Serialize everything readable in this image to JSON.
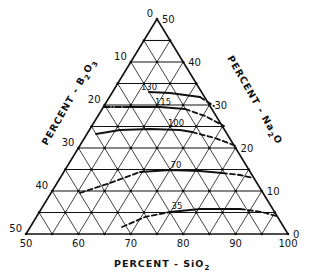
{
  "diagram": {
    "type": "ternary",
    "vertices": {
      "top": {
        "x": 157,
        "y": 19
      },
      "left": {
        "x": 26,
        "y": 234
      },
      "right": {
        "x": 288,
        "y": 234
      }
    },
    "divisions": 10,
    "axes": {
      "b2o3": {
        "title": "PERCENT - B",
        "sub": "2",
        "title_tail": "O",
        "sub2": "3",
        "ticks": [
          "0",
          "10",
          "20",
          "30",
          "40",
          "50"
        ]
      },
      "na2o": {
        "title": "PERCENT - Na",
        "sub": "2",
        "title_tail": "O",
        "ticks": [
          "50",
          "40",
          "30",
          "20",
          "10",
          "0"
        ]
      },
      "sio2": {
        "title": "PERCENT - SiO",
        "sub": "2",
        "ticks": [
          "50",
          "60",
          "70",
          "80",
          "90",
          "100"
        ]
      }
    },
    "contours": [
      {
        "label": "130",
        "label_pos": {
          "x": 149,
          "y": 90
        },
        "solid": [
          [
            149,
            92
          ],
          [
            170,
            93
          ],
          [
            200,
            97
          ]
        ],
        "dashed": [
          [
            200,
            97
          ],
          [
            214,
            106
          ]
        ]
      },
      {
        "label": "115",
        "label_pos": {
          "x": 163,
          "y": 105
        },
        "dashdot": [
          [
            104,
            107
          ],
          [
            125,
            107
          ]
        ],
        "solid": [
          [
            125,
            107
          ],
          [
            160,
            107
          ],
          [
            185,
            109
          ]
        ],
        "dashed": [
          [
            185,
            109
          ],
          [
            205,
            116
          ],
          [
            224,
            126
          ]
        ]
      },
      {
        "label": "100",
        "label_pos": {
          "x": 176,
          "y": 126
        },
        "solid": [
          [
            96,
            134
          ],
          [
            120,
            130
          ],
          [
            150,
            129
          ],
          [
            180,
            130
          ],
          [
            192,
            132
          ]
        ],
        "dashed": [
          [
            192,
            132
          ],
          [
            215,
            138
          ],
          [
            236,
            146
          ]
        ]
      },
      {
        "label": "70",
        "label_pos": {
          "x": 176,
          "y": 168
        },
        "dashed_start": [
          [
            80,
            193
          ],
          [
            110,
            183
          ],
          [
            140,
            172
          ]
        ],
        "solid": [
          [
            140,
            172
          ],
          [
            170,
            170
          ],
          [
            200,
            171
          ],
          [
            222,
            173
          ]
        ],
        "dashed": [
          [
            222,
            173
          ],
          [
            240,
            175
          ],
          [
            253,
            178
          ]
        ]
      },
      {
        "label": "35",
        "label_pos": {
          "x": 177,
          "y": 209
        },
        "dashed_start": [
          [
            122,
            227
          ],
          [
            145,
            217
          ],
          [
            170,
            212
          ]
        ],
        "solid": [
          [
            170,
            212
          ],
          [
            200,
            209
          ],
          [
            240,
            209
          ]
        ],
        "dashed": [
          [
            240,
            209
          ],
          [
            262,
            212
          ],
          [
            276,
            216
          ]
        ]
      }
    ]
  }
}
